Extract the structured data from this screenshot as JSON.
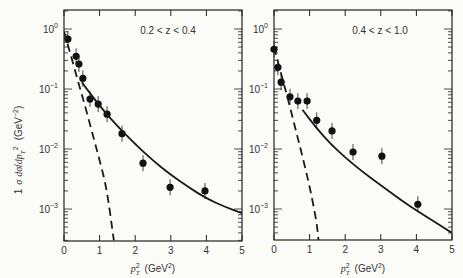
{
  "chart_data": [
    {
      "type": "scatter",
      "panel_label": "0.2 < z < 0.4",
      "xlabel": "p_T^2 (GeV^2)",
      "ylabel": "1/σ dσ/dp_T^2 (GeV^-2)",
      "xlim": [
        0,
        5
      ],
      "ylim": [
        0.0003,
        2
      ],
      "yscale": "log",
      "xticks": [
        "0",
        "1",
        "2",
        "3",
        "4",
        "5"
      ],
      "yticks": [
        "10^0",
        "10^-1",
        "10^-2",
        "10^-3"
      ],
      "grid": false,
      "series": [
        {
          "name": "data",
          "style": "points",
          "x": [
            0.11,
            0.34,
            0.42,
            0.53,
            0.73,
            0.96,
            1.21,
            1.63,
            2.22,
            2.98,
            3.96
          ],
          "y": [
            0.68,
            0.35,
            0.26,
            0.15,
            0.068,
            0.056,
            0.038,
            0.018,
            0.0058,
            0.0023,
            0.002
          ]
        },
        {
          "name": "solid curve",
          "style": "solid",
          "x": [
            0.5,
            1.0,
            1.5,
            2.0,
            2.5,
            3.0,
            3.5,
            4.0,
            4.5,
            5.0
          ],
          "y": [
            0.13,
            0.052,
            0.024,
            0.012,
            0.0064,
            0.0037,
            0.0023,
            0.0015,
            0.0011,
            0.00085
          ]
        },
        {
          "name": "dashed curve",
          "style": "dashed",
          "x": [
            0.0,
            0.2,
            0.4,
            0.6,
            0.8,
            1.0,
            1.2,
            1.4
          ],
          "y": [
            0.9,
            0.35,
            0.13,
            0.05,
            0.018,
            0.0065,
            0.0022,
            0.0003
          ]
        }
      ]
    },
    {
      "type": "scatter",
      "panel_label": "0.4 < z < 1.0",
      "xlabel": "p_T^2 (GeV^2)",
      "ylabel": "",
      "xlim": [
        0,
        5
      ],
      "ylim": [
        0.0003,
        2
      ],
      "yscale": "log",
      "xticks": [
        "0",
        "1",
        "2",
        "3",
        "4",
        "5"
      ],
      "yticks": [
        "10^0",
        "10^-1",
        "10^-2",
        "10^-3"
      ],
      "grid": false,
      "series": [
        {
          "name": "data",
          "style": "points",
          "x": [
            0.0,
            0.11,
            0.2,
            0.45,
            0.67,
            0.93,
            1.2,
            1.63,
            2.22,
            3.03,
            4.04
          ],
          "y": [
            0.46,
            0.23,
            0.13,
            0.074,
            0.063,
            0.063,
            0.03,
            0.02,
            0.0089,
            0.0076,
            0.0012
          ]
        },
        {
          "name": "solid curve",
          "style": "solid",
          "x": [
            0.8,
            1.2,
            1.6,
            2.0,
            2.5,
            3.0,
            3.5,
            4.0,
            4.5,
            5.0
          ],
          "y": [
            0.045,
            0.022,
            0.012,
            0.0072,
            0.0041,
            0.0025,
            0.0015,
            0.00095,
            0.00062,
            0.0004
          ]
        },
        {
          "name": "dashed curve",
          "style": "dashed",
          "x": [
            0.0,
            0.2,
            0.4,
            0.6,
            0.8,
            1.0,
            1.2,
            1.25
          ],
          "y": [
            0.5,
            0.18,
            0.065,
            0.022,
            0.0075,
            0.0024,
            0.0006,
            0.0003
          ]
        }
      ]
    }
  ],
  "panels": [
    {
      "label": "0.2 < z < 0.4"
    },
    {
      "label": "0.4 < z < 1.0"
    }
  ],
  "axes": {
    "xticks": [
      "0",
      "1",
      "2",
      "3",
      "4",
      "5"
    ],
    "yticks": {
      "d0": "0",
      "d1": "−1",
      "d2": "−2",
      "d3": "−3"
    },
    "xlabel_main": "p",
    "xlabel_unit": "(GeV",
    "xlabel_close": ")",
    "ylabel_unit": "(GeV",
    "ylabel_close": ")"
  }
}
